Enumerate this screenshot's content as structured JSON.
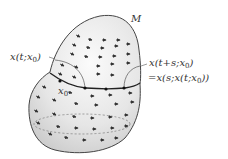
{
  "diagram": {
    "manifold_label": "M",
    "initial_point_label": "x",
    "initial_point_sub": "0",
    "label_left": "x(t;x",
    "label_left_sub": "0",
    "label_left_end": ")",
    "label_right_line1": "x(t+s;x",
    "label_right_line1_sub": "0",
    "label_right_line1_end": ")",
    "label_right_line2": "=x(s;x(t;x",
    "label_right_line2_sub": "0",
    "label_right_line2_end": "))",
    "colors": {
      "surface_fill": "#e4e4e4",
      "outline": "#444444",
      "orbit": "#222222",
      "arrows": "#333333"
    }
  }
}
